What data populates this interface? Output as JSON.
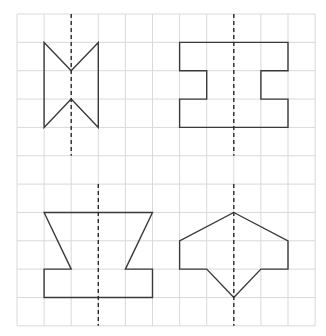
{
  "figure": {
    "grid": {
      "origin_x": 17,
      "origin_y": 14,
      "cell_w": 27.1,
      "cell_h": 28.35,
      "cols": 11,
      "rows": 11,
      "line_color": "#d9d9d9"
    },
    "stroke_color": "#3a3a3a",
    "panels": [
      {
        "name": "shape-bowtie-rectangle",
        "axis": {
          "col": 2,
          "row_start": 0,
          "row_end": 5
        },
        "points": [
          [
            1,
            1
          ],
          [
            2,
            2
          ],
          [
            3,
            1
          ],
          [
            3,
            4
          ],
          [
            2,
            3
          ],
          [
            1,
            4
          ]
        ]
      },
      {
        "name": "shape-i-beam",
        "axis": {
          "col": 8,
          "row_start": 0,
          "row_end": 5
        },
        "points": [
          [
            6,
            1
          ],
          [
            10,
            1
          ],
          [
            10,
            2
          ],
          [
            9,
            2
          ],
          [
            9,
            3
          ],
          [
            10,
            3
          ],
          [
            10,
            4
          ],
          [
            6,
            4
          ],
          [
            6,
            3
          ],
          [
            7,
            3
          ],
          [
            7,
            2
          ],
          [
            6,
            2
          ]
        ]
      },
      {
        "name": "shape-hourglass-base",
        "axis": {
          "col": 3,
          "row_start": 6,
          "row_end": 11
        },
        "points": [
          [
            1,
            7
          ],
          [
            5,
            7
          ],
          [
            4,
            9
          ],
          [
            5,
            9
          ],
          [
            5,
            10
          ],
          [
            1,
            10
          ],
          [
            1,
            9
          ],
          [
            2,
            9
          ]
        ]
      },
      {
        "name": "shape-arrowhead",
        "axis": {
          "col": 8,
          "row_start": 6,
          "row_end": 11
        },
        "points": [
          [
            8,
            7
          ],
          [
            10,
            8
          ],
          [
            10,
            9
          ],
          [
            9,
            9
          ],
          [
            8,
            10
          ],
          [
            7,
            9
          ],
          [
            6,
            9
          ],
          [
            6,
            8
          ]
        ]
      }
    ]
  }
}
